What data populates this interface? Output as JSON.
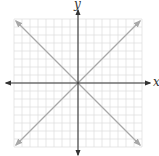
{
  "diagram": {
    "type": "coordinate-plane",
    "axes": {
      "x_label": "x",
      "y_label": "y"
    },
    "grid": {
      "cells": 16,
      "color": "#d9d9d9"
    },
    "lines": [
      {
        "name": "y = x",
        "color": "#a8a8a8"
      },
      {
        "name": "y = -x",
        "color": "#a8a8a8"
      }
    ],
    "axis_color": "#333333"
  }
}
